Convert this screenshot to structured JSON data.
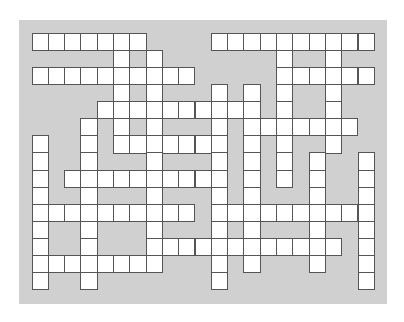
{
  "puzzle": {
    "type": "crossword",
    "rows": 15,
    "cols": 21,
    "cell_width": 16.3,
    "cell_height": 17.07,
    "colors": {
      "background": "#ffffff",
      "board": "#d0d0d0",
      "cell": "#ffffff",
      "cell_border": "#555555"
    },
    "white_cells_by_row": [
      [
        0,
        1,
        2,
        3,
        4,
        5,
        6,
        11,
        12,
        13,
        14,
        15,
        16,
        17,
        18,
        19,
        20
      ],
      [
        5,
        7,
        15,
        18
      ],
      [
        0,
        1,
        2,
        3,
        4,
        5,
        6,
        7,
        8,
        9,
        15,
        16,
        17,
        18,
        19,
        20
      ],
      [
        5,
        7,
        11,
        13,
        15,
        18
      ],
      [
        4,
        5,
        6,
        7,
        8,
        9,
        10,
        11,
        12,
        13,
        15,
        18
      ],
      [
        3,
        5,
        7,
        11,
        13,
        14,
        15,
        16,
        17,
        18,
        19
      ],
      [
        0,
        3,
        5,
        6,
        7,
        8,
        9,
        10,
        11,
        13,
        15,
        18
      ],
      [
        0,
        3,
        7,
        11,
        13,
        15,
        17,
        20
      ],
      [
        0,
        2,
        3,
        4,
        5,
        6,
        7,
        8,
        9,
        10,
        11,
        13,
        15,
        17,
        20
      ],
      [
        0,
        3,
        7,
        11,
        13,
        17,
        20
      ],
      [
        0,
        1,
        2,
        3,
        4,
        5,
        6,
        7,
        8,
        9,
        11,
        12,
        13,
        14,
        15,
        16,
        17,
        18,
        19,
        20
      ],
      [
        0,
        3,
        7,
        11,
        13,
        17,
        20
      ],
      [
        0,
        3,
        7,
        8,
        9,
        10,
        11,
        12,
        13,
        14,
        15,
        16,
        17,
        18,
        20
      ],
      [
        0,
        1,
        2,
        3,
        4,
        5,
        6,
        7,
        11,
        13,
        17,
        20
      ],
      [
        0,
        3,
        11,
        20
      ]
    ]
  }
}
